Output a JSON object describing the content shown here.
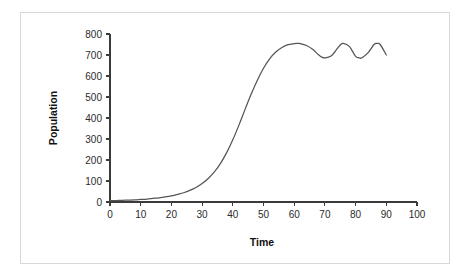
{
  "figure": {
    "border_color": "#d8d8d8",
    "background_color": "#ffffff"
  },
  "chart_data": {
    "type": "line",
    "title": "",
    "xlabel": "Time",
    "ylabel": "Population",
    "xlim": [
      0,
      100
    ],
    "ylim": [
      0,
      800
    ],
    "xticks": [
      0,
      10,
      20,
      30,
      40,
      50,
      60,
      70,
      80,
      90,
      100
    ],
    "yticks": [
      0,
      100,
      200,
      300,
      400,
      500,
      600,
      700,
      800
    ],
    "xtick_labels": [
      "0",
      "10",
      "20",
      "30",
      "40",
      "50",
      "60",
      "70",
      "80",
      "90",
      "100"
    ],
    "ytick_labels": [
      "0",
      "100",
      "200",
      "300",
      "400",
      "500",
      "600",
      "700",
      "800"
    ],
    "grid": false,
    "legend": null,
    "line_color": "#555555",
    "series": [
      {
        "name": "Population",
        "x": [
          0,
          2,
          4,
          6,
          8,
          10,
          12,
          14,
          16,
          18,
          20,
          22,
          24,
          26,
          28,
          30,
          32,
          34,
          36,
          38,
          40,
          42,
          44,
          46,
          48,
          50,
          52,
          54,
          56,
          58,
          60,
          61,
          62,
          64,
          66,
          68,
          69,
          70,
          72,
          74,
          75,
          76,
          78,
          80,
          81,
          82,
          84,
          86,
          87,
          88,
          90
        ],
        "y": [
          6,
          7,
          8,
          9,
          10,
          12,
          14,
          17,
          20,
          24,
          29,
          36,
          44,
          55,
          69,
          88,
          112,
          143,
          184,
          235,
          296,
          366,
          441,
          514,
          580,
          637,
          682,
          714,
          736,
          749,
          754,
          755,
          754,
          745,
          727,
          700,
          690,
          686,
          695,
          730,
          748,
          755,
          740,
          693,
          687,
          686,
          710,
          750,
          755,
          750,
          700
        ]
      }
    ],
    "annotations": []
  }
}
